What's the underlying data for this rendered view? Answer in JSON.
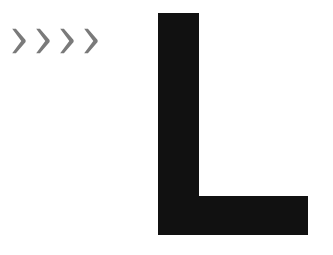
{
  "canvas": {
    "width": 333,
    "height": 255,
    "background_color": "#ffffff"
  },
  "chevron_group": {
    "name": "chevron-arrows",
    "count": 4,
    "direction": "right",
    "color": "#7a7a7a",
    "glyph": ">",
    "items": [
      {
        "icon": "chevron-right-icon",
        "label": ">"
      },
      {
        "icon": "chevron-right-icon",
        "label": ">"
      },
      {
        "icon": "chevron-right-icon",
        "label": ">"
      },
      {
        "icon": "chevron-right-icon",
        "label": ">"
      }
    ]
  },
  "letter_mark": {
    "name": "letter-l-glyph",
    "character": "L",
    "color": "#111111",
    "stem_width": 41,
    "arm_height": 39,
    "total_width": 150,
    "total_height": 222
  }
}
